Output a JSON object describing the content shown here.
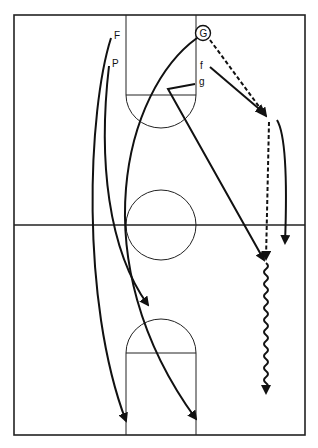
{
  "diagram": {
    "type": "basketball-play",
    "colors": {
      "line": "#111111",
      "background": "#ffffff"
    },
    "players": [
      {
        "id": "G",
        "label": "G",
        "circled": true,
        "x": 203,
        "y": 33
      },
      {
        "id": "F",
        "label": "F",
        "circled": false,
        "x": 118,
        "y": 38
      },
      {
        "id": "P",
        "label": "P",
        "circled": false,
        "x": 116,
        "y": 66
      },
      {
        "id": "f",
        "label": "f",
        "circled": false,
        "x": 202,
        "y": 68
      },
      {
        "id": "g",
        "label": "g",
        "circled": false,
        "x": 200,
        "y": 85
      }
    ],
    "legend": {
      "solid_arrow": "cut / move",
      "dashed_arrow": "pass",
      "wavy_arrow": "dribble"
    }
  }
}
